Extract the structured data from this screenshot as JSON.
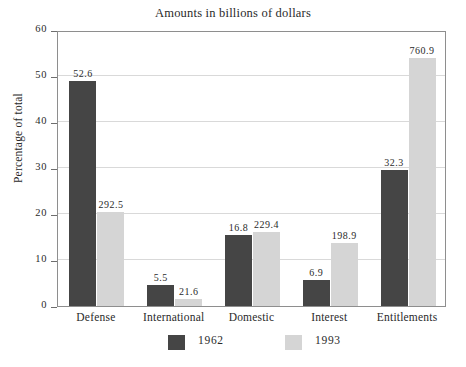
{
  "chart_data": {
    "type": "bar",
    "title": "Amounts in billions of dollars",
    "xlabel": "",
    "ylabel": "Percentage of total",
    "ylim": [
      0,
      60
    ],
    "yticks": [
      0,
      10,
      20,
      30,
      40,
      50,
      60
    ],
    "ytick_labels": [
      "0",
      "10",
      "20",
      "30",
      "40",
      "50",
      "60"
    ],
    "grid": true,
    "legend_position": "bottom",
    "categories": [
      "Defense",
      "International",
      "Domestic",
      "Interest",
      "Entitlements"
    ],
    "series": [
      {
        "name": "1962",
        "color": "#454545",
        "values": [
          49.0,
          4.5,
          15.5,
          5.7,
          29.5
        ],
        "data_labels": [
          "52.6",
          "5.5",
          "16.8",
          "6.9",
          "32.3"
        ]
      },
      {
        "name": "1993",
        "color": "#d5d5d5",
        "values": [
          20.5,
          1.5,
          16.0,
          13.8,
          54.0
        ],
        "data_labels": [
          "292.5",
          "21.6",
          "229.4",
          "198.9",
          "760.9"
        ]
      }
    ],
    "value_note": "Bar heights are percentage of total; printed data labels are amounts in billions of dollars."
  },
  "legend": {
    "entries": [
      {
        "label": "1962",
        "color": "#454545"
      },
      {
        "label": "1993",
        "color": "#d5d5d5"
      }
    ]
  },
  "colors": {
    "series_1962": "#454545",
    "series_1993": "#d5d5d5",
    "gridline": "#d9d9d9",
    "frame": "#8e8e8e",
    "text": "#2a2a2a",
    "background": "#ffffff"
  }
}
